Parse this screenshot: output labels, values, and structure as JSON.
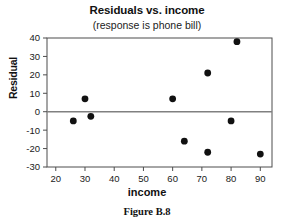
{
  "figure": {
    "caption": "Figure B.8"
  },
  "chart_data": {
    "type": "scatter",
    "title": "Residuals vs. income",
    "subtitle": "(response is phone bill)",
    "xlabel": "income",
    "ylabel": "Residual",
    "xlim": [
      17,
      94
    ],
    "ylim": [
      -30,
      40
    ],
    "xticks": [
      20,
      30,
      40,
      50,
      60,
      70,
      80,
      90
    ],
    "yticks": [
      -30,
      -20,
      -10,
      0,
      10,
      20,
      30,
      40
    ],
    "xtick_labels": [
      "20",
      "30",
      "40",
      "50",
      "60",
      "70",
      "80",
      "90"
    ],
    "ytick_labels": [
      "-30",
      "-20",
      "-10",
      "0",
      "10",
      "20",
      "30",
      "40"
    ],
    "grid": false,
    "legend": false,
    "reference_line": {
      "axis": "y",
      "value": 0,
      "color": "#808080"
    },
    "marker": {
      "shape": "circle",
      "color": "#111111",
      "size": 3.4
    },
    "points": [
      {
        "x": 26,
        "y": -5
      },
      {
        "x": 30,
        "y": 7
      },
      {
        "x": 32,
        "y": -2.5
      },
      {
        "x": 60,
        "y": 7
      },
      {
        "x": 64,
        "y": -16
      },
      {
        "x": 72,
        "y": 21
      },
      {
        "x": 72,
        "y": -22
      },
      {
        "x": 80,
        "y": -5
      },
      {
        "x": 82,
        "y": 38
      },
      {
        "x": 90,
        "y": -23
      }
    ],
    "series": [
      {
        "name": "Residual",
        "x": [
          26,
          30,
          32,
          60,
          64,
          72,
          72,
          80,
          82,
          90
        ],
        "values": [
          -5,
          7,
          -2.5,
          7,
          -16,
          21,
          -22,
          -5,
          38,
          -23
        ]
      }
    ]
  }
}
